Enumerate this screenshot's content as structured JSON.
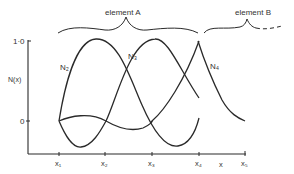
{
  "diagram": {
    "type": "finite-element-shape-functions",
    "braces": {
      "element_a": "element  A",
      "element_b": "element  B"
    },
    "y_axis": {
      "label": "N(x)",
      "ticks": [
        "1·0",
        "0"
      ]
    },
    "x_axis": {
      "label": "x",
      "ticks": [
        "x₁",
        "x₂",
        "x₃",
        "x₄",
        "x₅"
      ]
    },
    "curves": [
      {
        "name": "N₂"
      },
      {
        "name": "N₃"
      },
      {
        "name": "N₄"
      }
    ],
    "colors": {
      "line": "#2a2a2a",
      "text": "#333333"
    }
  }
}
